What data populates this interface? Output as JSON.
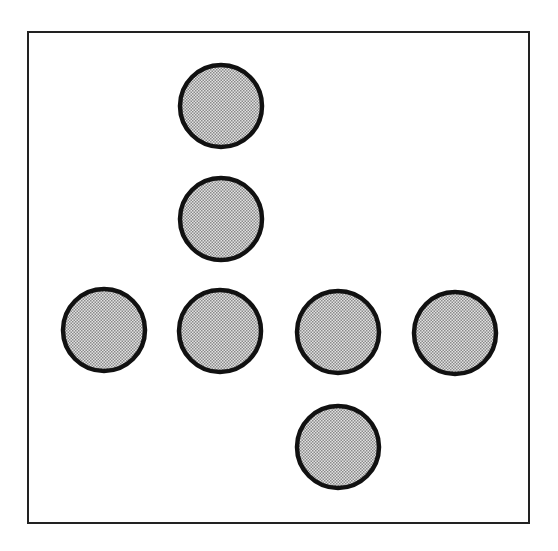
{
  "diagram": {
    "frame": {
      "x": 28,
      "y": 32,
      "width": 501,
      "height": 491,
      "stroke": "#222222",
      "stroke_width": 2
    },
    "circle_style": {
      "radius": 41,
      "fill": "#cfcfcf",
      "dot_color": "#8a8a8a",
      "stroke": "#111111",
      "stroke_width": 4.5
    },
    "circles": [
      {
        "id": "top",
        "cx": 221,
        "cy": 106
      },
      {
        "id": "upper-middle",
        "cx": 221,
        "cy": 219
      },
      {
        "id": "row-1",
        "cx": 104,
        "cy": 330
      },
      {
        "id": "row-2",
        "cx": 220,
        "cy": 331
      },
      {
        "id": "row-3",
        "cx": 338,
        "cy": 332
      },
      {
        "id": "row-4",
        "cx": 455,
        "cy": 333
      },
      {
        "id": "bottom",
        "cx": 338,
        "cy": 447
      }
    ]
  }
}
